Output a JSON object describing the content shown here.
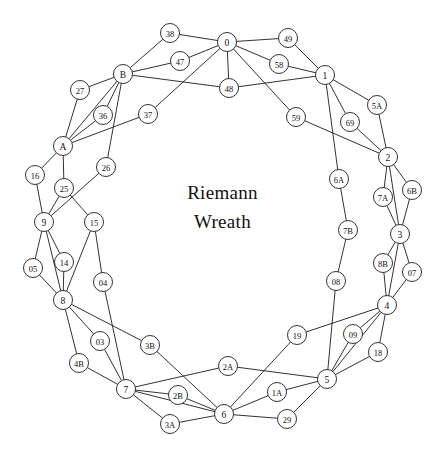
{
  "figure": {
    "title_line1": "Riemann",
    "title_line2": "Wreath",
    "background_color": "#ffffff",
    "stroke_color": "#1c1c1c",
    "node_fill": "#ffffff",
    "node_radius": 9.5
  },
  "graph_data": {
    "type": "node-link-diagram",
    "node_count": 60,
    "nodes": [
      {
        "id": "0",
        "label": "0",
        "x": 227,
        "y": 42
      },
      {
        "id": "1",
        "label": "1",
        "x": 325,
        "y": 75
      },
      {
        "id": "2",
        "label": "2",
        "x": 388,
        "y": 157
      },
      {
        "id": "3",
        "label": "3",
        "x": 400,
        "y": 234
      },
      {
        "id": "4",
        "label": "4",
        "x": 387,
        "y": 305
      },
      {
        "id": "5",
        "label": "5",
        "x": 327,
        "y": 379
      },
      {
        "id": "6",
        "label": "6",
        "x": 224,
        "y": 414
      },
      {
        "id": "7",
        "label": "7",
        "x": 126,
        "y": 389
      },
      {
        "id": "8",
        "label": "8",
        "x": 63,
        "y": 300
      },
      {
        "id": "9",
        "label": "9",
        "x": 44,
        "y": 222
      },
      {
        "id": "A",
        "label": "A",
        "x": 63,
        "y": 146
      },
      {
        "id": "B",
        "label": "B",
        "x": 123,
        "y": 74
      },
      {
        "id": "38",
        "label": "38",
        "x": 170,
        "y": 33
      },
      {
        "id": "49",
        "label": "49",
        "x": 288,
        "y": 38
      },
      {
        "id": "47",
        "label": "47",
        "x": 180,
        "y": 61
      },
      {
        "id": "58",
        "label": "58",
        "x": 279,
        "y": 64
      },
      {
        "id": "48",
        "label": "48",
        "x": 229,
        "y": 88
      },
      {
        "id": "27",
        "label": "27",
        "x": 80,
        "y": 90
      },
      {
        "id": "5A",
        "label": "5A",
        "x": 377,
        "y": 105
      },
      {
        "id": "36",
        "label": "36",
        "x": 103,
        "y": 115
      },
      {
        "id": "37",
        "label": "37",
        "x": 148,
        "y": 114
      },
      {
        "id": "59",
        "label": "59",
        "x": 296,
        "y": 117
      },
      {
        "id": "69",
        "label": "69",
        "x": 350,
        "y": 122
      },
      {
        "id": "16",
        "label": "16",
        "x": 35,
        "y": 175
      },
      {
        "id": "26",
        "label": "26",
        "x": 106,
        "y": 167
      },
      {
        "id": "6A",
        "label": "6A",
        "x": 339,
        "y": 179
      },
      {
        "id": "25",
        "label": "25",
        "x": 64,
        "y": 188
      },
      {
        "id": "6B",
        "label": "6B",
        "x": 412,
        "y": 190
      },
      {
        "id": "7A",
        "label": "7A",
        "x": 383,
        "y": 197
      },
      {
        "id": "15",
        "label": "15",
        "x": 94,
        "y": 222
      },
      {
        "id": "7B",
        "label": "7B",
        "x": 348,
        "y": 230
      },
      {
        "id": "05",
        "label": "05",
        "x": 33,
        "y": 268
      },
      {
        "id": "14",
        "label": "14",
        "x": 64,
        "y": 262
      },
      {
        "id": "8B",
        "label": "8B",
        "x": 383,
        "y": 263
      },
      {
        "id": "07",
        "label": "07",
        "x": 412,
        "y": 272
      },
      {
        "id": "04",
        "label": "04",
        "x": 103,
        "y": 282
      },
      {
        "id": "08",
        "label": "08",
        "x": 336,
        "y": 281
      },
      {
        "id": "03",
        "label": "03",
        "x": 100,
        "y": 341
      },
      {
        "id": "3B",
        "label": "3B",
        "x": 150,
        "y": 345
      },
      {
        "id": "19",
        "label": "19",
        "x": 297,
        "y": 335
      },
      {
        "id": "09",
        "label": "09",
        "x": 353,
        "y": 334
      },
      {
        "id": "18",
        "label": "18",
        "x": 378,
        "y": 352
      },
      {
        "id": "4B",
        "label": "4B",
        "x": 79,
        "y": 363
      },
      {
        "id": "2A",
        "label": "2A",
        "x": 228,
        "y": 366
      },
      {
        "id": "2B",
        "label": "2B",
        "x": 178,
        "y": 395
      },
      {
        "id": "1A",
        "label": "1A",
        "x": 277,
        "y": 392
      },
      {
        "id": "3A",
        "label": "3A",
        "x": 170,
        "y": 424
      },
      {
        "id": "29",
        "label": "29",
        "x": 287,
        "y": 419
      }
    ],
    "edges": [
      [
        "0",
        "38"
      ],
      [
        "0",
        "49"
      ],
      [
        "0",
        "47"
      ],
      [
        "0",
        "58"
      ],
      [
        "0",
        "48"
      ],
      [
        "0",
        "59"
      ],
      [
        "0",
        "37"
      ],
      [
        "38",
        "B"
      ],
      [
        "49",
        "1"
      ],
      [
        "47",
        "B"
      ],
      [
        "58",
        "1"
      ],
      [
        "48",
        "B"
      ],
      [
        "48",
        "1"
      ],
      [
        "1",
        "5A"
      ],
      [
        "1",
        "69"
      ],
      [
        "1",
        "6A"
      ],
      [
        "59",
        "2"
      ],
      [
        "5A",
        "2"
      ],
      [
        "69",
        "2"
      ],
      [
        "2",
        "7A"
      ],
      [
        "2",
        "6B"
      ],
      [
        "2",
        "3"
      ],
      [
        "6A",
        "7B"
      ],
      [
        "7A",
        "3"
      ],
      [
        "6B",
        "3"
      ],
      [
        "7B",
        "08"
      ],
      [
        "3",
        "8B"
      ],
      [
        "3",
        "07"
      ],
      [
        "3",
        "4"
      ],
      [
        "8B",
        "4"
      ],
      [
        "07",
        "4"
      ],
      [
        "08",
        "5"
      ],
      [
        "4",
        "09"
      ],
      [
        "4",
        "18"
      ],
      [
        "4",
        "19"
      ],
      [
        "4",
        "5"
      ],
      [
        "09",
        "5"
      ],
      [
        "18",
        "5"
      ],
      [
        "19",
        "6"
      ],
      [
        "5",
        "1A"
      ],
      [
        "5",
        "29"
      ],
      [
        "5",
        "2A"
      ],
      [
        "1A",
        "6"
      ],
      [
        "29",
        "6"
      ],
      [
        "2A",
        "7"
      ],
      [
        "6",
        "2B"
      ],
      [
        "6",
        "3A"
      ],
      [
        "6",
        "3B"
      ],
      [
        "6",
        "7"
      ],
      [
        "2B",
        "7"
      ],
      [
        "3A",
        "7"
      ],
      [
        "3B",
        "8"
      ],
      [
        "7",
        "03"
      ],
      [
        "7",
        "4B"
      ],
      [
        "7",
        "04"
      ],
      [
        "03",
        "8"
      ],
      [
        "4B",
        "8"
      ],
      [
        "04",
        "15"
      ],
      [
        "8",
        "05"
      ],
      [
        "8",
        "14"
      ],
      [
        "8",
        "15"
      ],
      [
        "8",
        "9"
      ],
      [
        "05",
        "9"
      ],
      [
        "14",
        "9"
      ],
      [
        "15",
        "25"
      ],
      [
        "9",
        "16"
      ],
      [
        "9",
        "25"
      ],
      [
        "9",
        "26"
      ],
      [
        "16",
        "A"
      ],
      [
        "25",
        "A"
      ],
      [
        "26",
        "B"
      ],
      [
        "A",
        "27"
      ],
      [
        "A",
        "36"
      ],
      [
        "A",
        "37"
      ],
      [
        "A",
        "B"
      ],
      [
        "27",
        "B"
      ],
      [
        "36",
        "B"
      ]
    ]
  }
}
